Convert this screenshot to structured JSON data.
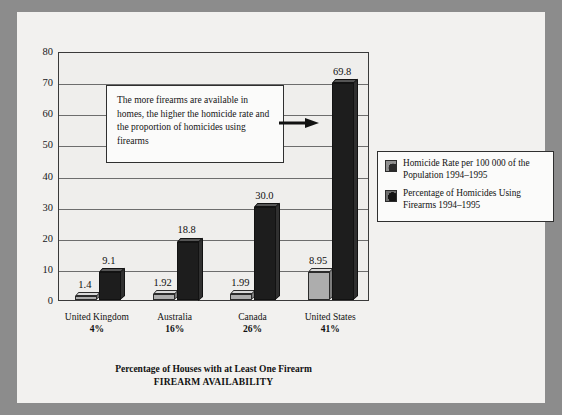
{
  "chart_data": {
    "type": "bar",
    "title": "",
    "xlabel": "Percentage of Houses with at Least One Firearm",
    "xlabel2": "FIREARM AVAILABILITY",
    "ylabel": "",
    "ylim": [
      0,
      80
    ],
    "yticks": [
      "0",
      "10",
      "20",
      "30",
      "40",
      "50",
      "60",
      "70",
      "80"
    ],
    "grid": true,
    "legend_position": "right",
    "categories": [
      "United Kingdom",
      "Australia",
      "Canada",
      "United States"
    ],
    "category_sublabels": [
      "4%",
      "16%",
      "26%",
      "41%"
    ],
    "series": [
      {
        "name": "Homicide Rate per 100 000 of the Population 1994–1995",
        "values": [
          1.4,
          1.92,
          1.99,
          8.95
        ],
        "labels": [
          "1.4",
          "1.92",
          "1.99",
          "8.95"
        ],
        "color": "#adadad"
      },
      {
        "name": "Percentage of Homicides Using Firearms 1994–1995",
        "values": [
          9.1,
          18.8,
          30.0,
          69.8
        ],
        "labels": [
          "9.1",
          "18.8",
          "30.0",
          "69.8"
        ],
        "color": "#1d1d1d"
      }
    ],
    "annotations": [
      {
        "text": "The more firearms are available in homes, the higher the homicide rate and the proportion of homicides using firearms",
        "arrow": "right-arrow"
      }
    ]
  },
  "legend": {
    "items": [
      {
        "label": "Homicide Rate per 100 000 of the Population 1994–1995",
        "swatch": "legend-swatch-light"
      },
      {
        "label": "Percentage of Homicides Using Firearms 1994–1995",
        "swatch": "legend-swatch-dark"
      }
    ]
  }
}
